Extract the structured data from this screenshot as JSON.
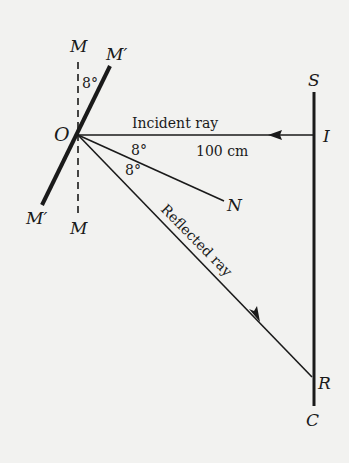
{
  "diagram": {
    "title": "",
    "labels": {
      "mirror_normal_top": "M",
      "mirror_normal_bottom": "M",
      "mirror_rotated_top": "M′",
      "mirror_rotated_bottom": "M′",
      "origin": "O",
      "screen_top": "S",
      "incident_point": "I",
      "normal_end": "N",
      "reflected_point": "R",
      "screen_bottom": "C"
    },
    "angles": {
      "mirror_rotation": "8°",
      "incidence": "8°",
      "reflection": "8°"
    },
    "rays": {
      "incident_label": "Incident ray",
      "reflected_label": "Reflected ray",
      "distance": "100 cm"
    },
    "colors": {
      "ink": "#1a1a1a",
      "paper": "#f2f2f0"
    }
  }
}
